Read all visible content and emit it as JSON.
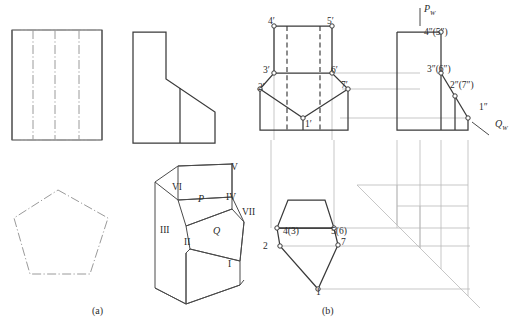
{
  "figure": {
    "captions": [
      {
        "id": "caption-a",
        "text": "(a)",
        "x": 92,
        "y": 314
      },
      {
        "id": "caption-b",
        "text": "(b)",
        "x": 322,
        "y": 314
      }
    ]
  },
  "panel_a": {
    "name": "Three-view drawing and pictorial of truncated pentagonal prism",
    "top_view": {
      "name": "rectangular-top-view",
      "rect": {
        "x": 12,
        "y": 30,
        "w": 90,
        "h": 110
      },
      "interior_vertical_lines_x": [
        33,
        55,
        79
      ]
    },
    "front_view": {
      "name": "stepped-front-view",
      "outline_points": "133,32 166,32 166,79 215,112 215,143 133,143",
      "inner_vertical_line": {
        "x": 180,
        "y1": 88,
        "y2": 143
      }
    },
    "bottom_pentagon": {
      "name": "pentagon-bottom-left-view",
      "points": "58,190 108,218 90,274 30,274 14,218"
    },
    "pictorial": {
      "name": "isometric-pictorial",
      "labels": [
        {
          "text": "V",
          "x": 231,
          "y": 170
        },
        {
          "text": "VI",
          "x": 172,
          "y": 190
        },
        {
          "text": "IV",
          "x": 226,
          "y": 200
        },
        {
          "text": "VII",
          "x": 242,
          "y": 215
        },
        {
          "text": "III",
          "x": 160,
          "y": 233
        },
        {
          "text": "II",
          "x": 184,
          "y": 245
        },
        {
          "text": "I",
          "x": 228,
          "y": 267
        },
        {
          "text": "P",
          "x": 198,
          "y": 202,
          "italic": true
        },
        {
          "text": "Q",
          "x": 213,
          "y": 234,
          "italic": true
        }
      ]
    }
  },
  "panel_b": {
    "name": "Projection construction diagram with numbered vertices",
    "front_view_labels": [
      {
        "text": "4′",
        "x": 268,
        "y": 24
      },
      {
        "text": "5′",
        "x": 327,
        "y": 24
      },
      {
        "text": "3′",
        "x": 263,
        "y": 73
      },
      {
        "text": "6′",
        "x": 331,
        "y": 73
      },
      {
        "text": "2′",
        "x": 258,
        "y": 90
      },
      {
        "text": "7′",
        "x": 341,
        "y": 88
      },
      {
        "text": "1′",
        "x": 305,
        "y": 127
      }
    ],
    "side_view_labels": [
      {
        "text": "4″(5″)",
        "x": 424,
        "y": 35
      },
      {
        "text": "3″(6″)",
        "x": 427,
        "y": 72
      },
      {
        "text": "2″(7″)",
        "x": 450,
        "y": 88
      },
      {
        "text": "1″",
        "x": 479,
        "y": 110
      }
    ],
    "axis_labels": [
      {
        "text": "P",
        "sub": "W",
        "x": 424,
        "y": 12
      },
      {
        "text": "Q",
        "sub": "W",
        "x": 495,
        "y": 127
      }
    ],
    "top_view_labels": [
      {
        "text": "4(3)",
        "x": 283,
        "y": 234
      },
      {
        "text": "5(6)",
        "x": 331,
        "y": 234
      },
      {
        "text": "2",
        "x": 263,
        "y": 249
      },
      {
        "text": "7",
        "x": 341,
        "y": 245
      },
      {
        "text": "1",
        "x": 316,
        "y": 295
      }
    ]
  }
}
